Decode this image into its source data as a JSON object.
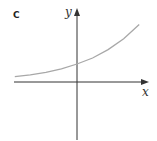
{
  "chart_data": {
    "type": "line",
    "title": "",
    "panel_label": "C",
    "xlabel": "x",
    "ylabel": "y",
    "grid": false,
    "legend": null,
    "series": [
      {
        "name": "curve",
        "color": "#a8a8a8",
        "x": [
          -2,
          -1.5,
          -1,
          -0.5,
          0,
          0.5,
          1,
          1.5,
          2
        ],
        "y": [
          0.22,
          0.3,
          0.4,
          0.55,
          0.75,
          1.0,
          1.35,
          1.8,
          2.4
        ]
      }
    ],
    "axis_color": "#333333",
    "ticks": []
  }
}
